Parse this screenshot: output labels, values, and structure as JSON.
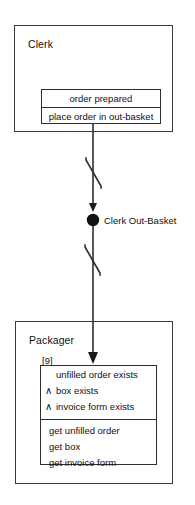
{
  "diagram": {
    "type": "role-activity-diagram",
    "stroke_color": "#2e2e2e",
    "text_color": "#111111",
    "background": "#ffffff"
  },
  "roles": [
    {
      "id": "clerk",
      "title": "Clerk",
      "activity": {
        "state_label": "order prepared",
        "action_label": "place order in out-basket"
      }
    },
    {
      "id": "packager",
      "title": "Packager",
      "index_label": "[9]",
      "rule": {
        "conditions": [
          {
            "operator": "",
            "text": "unfilled order exists"
          },
          {
            "operator": "∧",
            "text": "box exists"
          },
          {
            "operator": "∧",
            "text": "invoice form exists"
          }
        ],
        "actions": [
          "get unfilled order",
          "get box",
          "get invoice form"
        ]
      }
    }
  ],
  "interaction_point": {
    "label": "Clerk Out-Basket",
    "marker": "filled-circle"
  },
  "connectors": [
    {
      "id": "clerk-to-outbasket",
      "marker": "interrupt-zigzag",
      "arrowhead": "filled-triangle-down"
    },
    {
      "id": "outbasket-to-packager",
      "marker": "interrupt-zigzag",
      "arrowhead": "filled-triangle-down"
    }
  ]
}
